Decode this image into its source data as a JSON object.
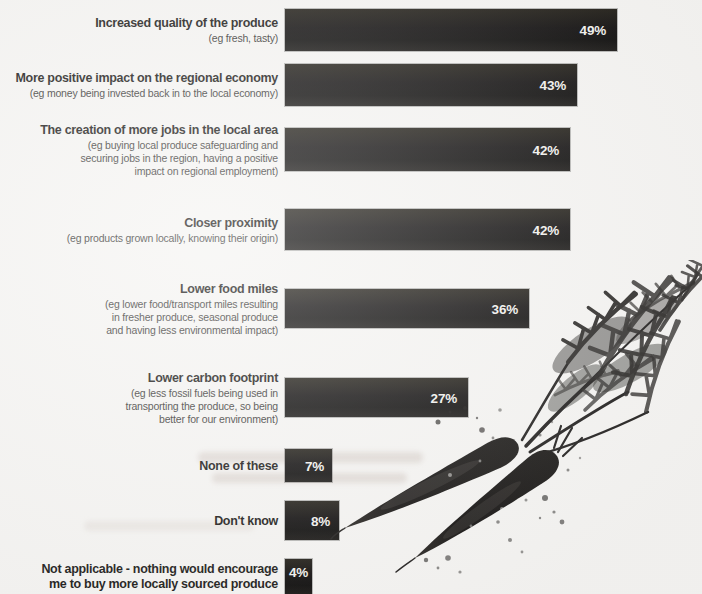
{
  "page": {
    "background_color": "#f5f4f2"
  },
  "chart_data": {
    "type": "bar",
    "orientation": "horizontal",
    "value_unit": "%",
    "axis_range": [
      0,
      50
    ],
    "grid": false,
    "legend": false,
    "bar_color": "#141210",
    "value_label_color": "#f2f1ee",
    "categories": [
      "Increased quality of the produce",
      "More positive impact on the regional economy",
      "The creation of more jobs in the local area",
      "Closer proximity",
      "Lower food miles",
      "Lower carbon footprint",
      "None of these",
      "Don't know",
      "Not applicable - nothing would encourage me to buy more locally sourced produce"
    ],
    "values": [
      49,
      43,
      42,
      42,
      36,
      27,
      7,
      8,
      4
    ],
    "rows": [
      {
        "label": "Increased quality of the produce",
        "sublabel": "(eg fresh, tasty)",
        "value": 49,
        "value_label": "49%"
      },
      {
        "label": "More positive impact on the regional economy",
        "sublabel": "(eg money being invested back in to the local economy)",
        "value": 43,
        "value_label": "43%"
      },
      {
        "label": "The creation of more jobs in the local area",
        "sublabel": "(eg buying local produce safeguarding and\nsecuring jobs in the region, having a positive\nimpact on regional employment)",
        "value": 42,
        "value_label": "42%"
      },
      {
        "label": "Closer proximity",
        "sublabel": "(eg products grown locally, knowing their origin)",
        "value": 42,
        "value_label": "42%"
      },
      {
        "label": "Lower food miles",
        "sublabel": "(eg lower food/transport miles resulting\nin fresher produce, seasonal produce\nand having less environmental impact)",
        "value": 36,
        "value_label": "36%"
      },
      {
        "label": "Lower carbon footprint",
        "sublabel": "(eg less fossil fuels being used in\ntransporting the produce, so being\nbetter for our environment)",
        "value": 27,
        "value_label": "27%"
      },
      {
        "label": "None of these",
        "sublabel": "",
        "value": 7,
        "value_label": "7%"
      },
      {
        "label": "Don't know",
        "sublabel": "",
        "value": 8,
        "value_label": "8%"
      },
      {
        "label": "Not applicable - nothing would encourage\nme to buy more locally sourced produce",
        "sublabel": "",
        "value": 4,
        "value_label": "4%"
      }
    ]
  },
  "illustration": {
    "name": "watercolor-carrots",
    "alt": "Black watercolor illustration of two carrots with feathery leafy tops and ink splatter"
  }
}
